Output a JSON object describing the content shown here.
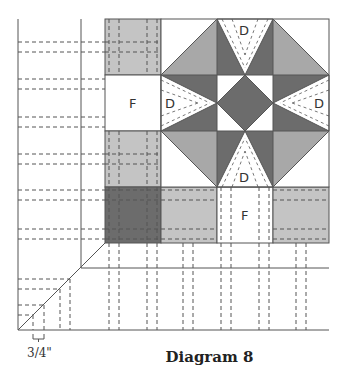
{
  "diagram": {
    "caption": "Diagram 8",
    "measurement_label": "3/4\"",
    "piece_labels": {
      "left_strip": "F",
      "bottom_strip": "F",
      "d_top": "D",
      "d_left": "D",
      "d_right": "D",
      "d_bottom": "D"
    },
    "colors": {
      "light_grey": "#c4c4c4",
      "mid_grey": "#a9a9a9",
      "dark_grey": "#6c6c6c",
      "line": "#555555",
      "white": "#ffffff"
    }
  }
}
